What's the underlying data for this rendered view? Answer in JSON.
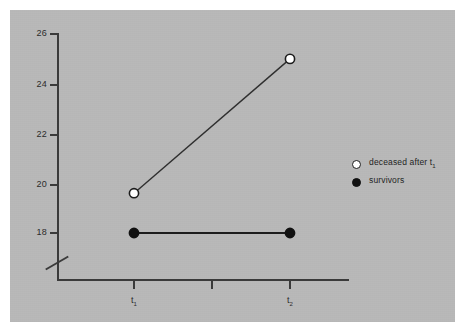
{
  "figure": {
    "background_color": "#ffffff",
    "panel_color": "#b9b9b9",
    "axis_color": "#3a3a3a",
    "width": 463,
    "height": 331
  },
  "chart_data": {
    "type": "line",
    "title": "",
    "subtitle": "",
    "xlabel": "",
    "ylabel": "",
    "x": [
      "t1",
      "",
      "t2"
    ],
    "x_tick_labels": [
      "t₁",
      "",
      "t₂"
    ],
    "x_tick_label_base": [
      "t",
      "",
      "t"
    ],
    "x_tick_label_sub": [
      "1",
      "",
      "2"
    ],
    "y_tick_labels": [
      "18",
      "20",
      "22",
      "24",
      "26"
    ],
    "y_ticks": [
      18,
      20,
      22,
      24,
      26
    ],
    "ylim": [
      17.2,
      26
    ],
    "y_axis_break": true,
    "grid": false,
    "legend_position": "right",
    "series": [
      {
        "name": "deceased after t1",
        "legend_label_base": "deceased after t",
        "legend_label_sub": "1",
        "marker": "open-circle",
        "marker_face_color": "#ffffff",
        "marker_edge_color": "#1c1c1c",
        "line_color": "#2f2f2f",
        "x": [
          "t1",
          "t2"
        ],
        "values": [
          19.6,
          25.0
        ]
      },
      {
        "name": "survivors",
        "legend_label_base": "survivors",
        "legend_label_sub": "",
        "marker": "filled-circle",
        "marker_face_color": "#111111",
        "marker_edge_color": "#111111",
        "line_color": "#1c1c1c",
        "x": [
          "t1",
          "t2"
        ],
        "values": [
          18.0,
          18.0
        ]
      }
    ]
  },
  "legend": {
    "entries": [
      {
        "label_base": "deceased after t",
        "label_sub": "1",
        "marker": "open-circle"
      },
      {
        "label_base": "survivors",
        "label_sub": "",
        "marker": "filled-circle"
      }
    ]
  }
}
